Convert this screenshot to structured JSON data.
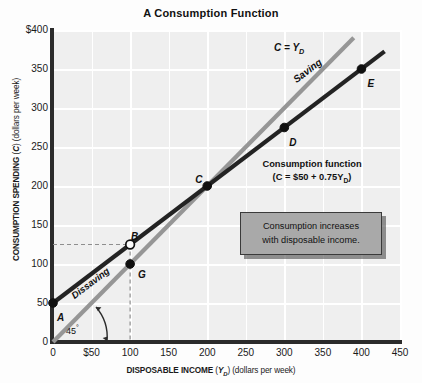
{
  "chart_data": {
    "type": "line",
    "title": "A Consumption Function",
    "xlabel_main": "DISPOSABLE INCOME",
    "xlabel_sym": "Y",
    "xlabel_sym_sub": "D",
    "xlabel_units": "(dollars per week)",
    "ylabel_main": "CONSUMPTION SPENDING",
    "ylabel_sym": "C",
    "ylabel_units": "(dollars per week)",
    "xlim": [
      0,
      450
    ],
    "ylim": [
      0,
      400
    ],
    "xticks": [
      "0",
      "$50",
      "100",
      "150",
      "200",
      "250",
      "300",
      "350",
      "400",
      "450"
    ],
    "xtick_values": [
      0,
      50,
      100,
      150,
      200,
      250,
      300,
      350,
      400,
      450
    ],
    "yticks": [
      "0",
      "50",
      "100",
      "150",
      "200",
      "250",
      "300",
      "350",
      "$400"
    ],
    "ytick_values": [
      0,
      50,
      100,
      150,
      200,
      250,
      300,
      350,
      400
    ],
    "grid": true,
    "legend": "none",
    "series": [
      {
        "name": "Consumption function",
        "equation": "C = $50 + 0.75Y_D",
        "color": "#232323",
        "x": [
          0,
          430
        ],
        "y": [
          50,
          372.5
        ],
        "intercept": 50,
        "slope": 0.75
      },
      {
        "name": "C = Y_D",
        "equation": "C = Y_D",
        "color": "#969696",
        "x": [
          0,
          390
        ],
        "y": [
          0,
          390
        ],
        "intercept": 0,
        "slope": 1
      }
    ],
    "points": [
      {
        "label": "A",
        "x": 0,
        "y": 50,
        "filled": true
      },
      {
        "label": "B",
        "x": 100,
        "y": 125,
        "filled": false
      },
      {
        "label": "C",
        "x": 200,
        "y": 200,
        "filled": true
      },
      {
        "label": "D",
        "x": 300,
        "y": 275,
        "filled": true
      },
      {
        "label": "E",
        "x": 400,
        "y": 350,
        "filled": true
      },
      {
        "label": "G",
        "x": 100,
        "y": 100,
        "filled": true
      }
    ],
    "annotations": {
      "line_45_label": "C = Y",
      "line_45_label_sub": "D",
      "saving": "Saving",
      "dissaving": "Dissaving",
      "angle": "45",
      "angle_degree_symbol": "°",
      "consumption_function_line1": "Consumption function",
      "consumption_function_line2_pre": "(C = $50 + 0.75Y",
      "consumption_function_line2_sub": "D",
      "consumption_function_line2_post": ")",
      "callout_line1": "Consumption increases",
      "callout_line2": "with disposable income."
    },
    "guides": [
      {
        "type": "dashed-horizontal",
        "y": 125,
        "from_x": 0,
        "to_x": 100
      },
      {
        "type": "dashed-vertical",
        "x": 100,
        "from_y": 0,
        "to_y": 125
      }
    ],
    "colors": {
      "plot_background": "#efefef",
      "gridline": "#ffffff",
      "axis": "#2b2b2b",
      "consumption_line": "#232323",
      "identity_line": "#969696",
      "callout_fill": "#a9a9a9",
      "callout_border": "#3a3a3a",
      "guide_dash": "#8e8e8e"
    }
  }
}
